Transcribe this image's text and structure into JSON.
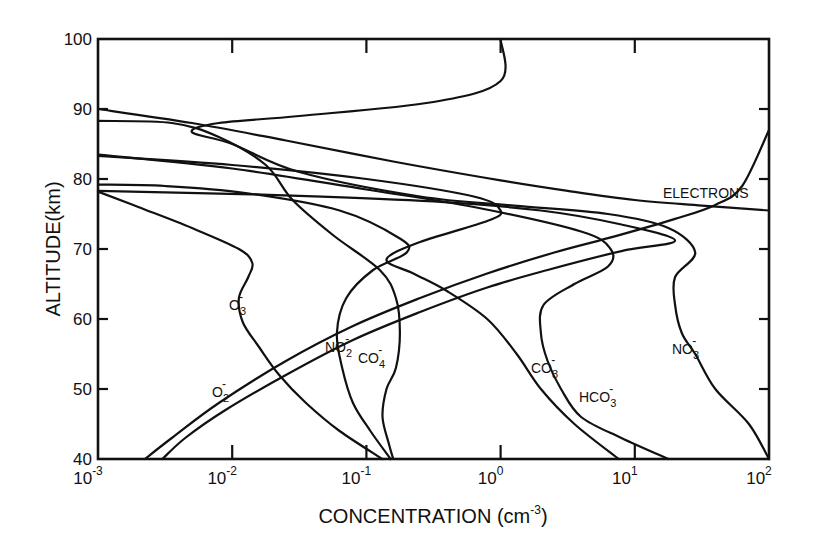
{
  "chart_data": {
    "type": "line",
    "title": "",
    "xlabel": "CONCENTRATION (cm^-3)",
    "ylabel": "ALTITUDE (km)",
    "xscale": "log",
    "xlim": [
      0.001,
      100
    ],
    "ylim": [
      40,
      100
    ],
    "grid": false,
    "legend": "inline labels",
    "x_ticks": [
      {
        "base": "10",
        "exp": "-3",
        "value": 0.001
      },
      {
        "base": "10",
        "exp": "-2",
        "value": 0.01
      },
      {
        "base": "10",
        "exp": "-1",
        "value": 0.1
      },
      {
        "base": "10",
        "exp": "0",
        "value": 1
      },
      {
        "base": "10",
        "exp": "1",
        "value": 10
      },
      {
        "base": "10",
        "exp": "2",
        "value": 100
      }
    ],
    "y_ticks": [
      40,
      50,
      60,
      70,
      80,
      90,
      100
    ],
    "series_note": "points are [log10(concentration), altitude_km]",
    "series": [
      {
        "name": "ELECTRONS",
        "points": [
          [
            -2.65,
            40
          ],
          [
            -2.45,
            43
          ],
          [
            -2.1,
            48
          ],
          [
            -1.6,
            54
          ],
          [
            -1.1,
            59
          ],
          [
            -0.6,
            63
          ],
          [
            -0.1,
            66.5
          ],
          [
            0.4,
            69.5
          ],
          [
            0.85,
            71.8
          ],
          [
            1.3,
            74.3
          ],
          [
            1.6,
            76.3
          ],
          [
            1.8,
            79
          ],
          [
            2.0,
            87
          ]
        ]
      },
      {
        "name": "O2-",
        "points": [
          [
            -2.52,
            40
          ],
          [
            -2.35,
            43
          ],
          [
            -2.05,
            47
          ],
          [
            -1.6,
            52
          ],
          [
            -1.1,
            57
          ],
          [
            -0.6,
            61
          ],
          [
            -0.1,
            64.5
          ],
          [
            0.35,
            67
          ],
          [
            0.9,
            69.7
          ],
          [
            1.3,
            71.2
          ],
          [
            0.9,
            73.5
          ],
          [
            0.3,
            75.5
          ],
          [
            -0.5,
            76.8
          ],
          [
            -1.5,
            77.6
          ],
          [
            -2.5,
            78.1
          ],
          [
            -3,
            78.3
          ]
        ]
      },
      {
        "name": "O3-",
        "points": [
          [
            -0.88,
            40
          ],
          [
            -1.2,
            44
          ],
          [
            -1.45,
            48
          ],
          [
            -1.65,
            52
          ],
          [
            -1.8,
            56
          ],
          [
            -1.92,
            59.5
          ],
          [
            -1.95,
            63
          ],
          [
            -1.88,
            66
          ],
          [
            -1.85,
            68
          ],
          [
            -1.95,
            70
          ],
          [
            -2.3,
            73
          ],
          [
            -2.7,
            76
          ],
          [
            -3,
            78.2
          ]
        ]
      },
      {
        "name": "NO2-",
        "points": [
          [
            -0.82,
            40
          ],
          [
            -0.97,
            44
          ],
          [
            -1.1,
            48
          ],
          [
            -1.18,
            53
          ],
          [
            -1.22,
            58
          ],
          [
            -1.15,
            63
          ],
          [
            -0.95,
            67
          ],
          [
            -0.7,
            69.5
          ],
          [
            -0.75,
            71.5
          ],
          [
            -1.2,
            75.5
          ],
          [
            -1.9,
            78
          ],
          [
            -2.5,
            79
          ],
          [
            -3,
            79.2
          ]
        ]
      },
      {
        "name": "CO4-",
        "points": [
          [
            -0.8,
            40
          ],
          [
            -0.83,
            42
          ],
          [
            -0.88,
            46
          ],
          [
            -0.85,
            50
          ],
          [
            -0.78,
            53
          ],
          [
            -0.75,
            58
          ],
          [
            -0.78,
            63
          ],
          [
            -0.9,
            67
          ],
          [
            -1.25,
            72
          ],
          [
            -1.55,
            77
          ],
          [
            -1.75,
            82
          ],
          [
            -2.1,
            86
          ],
          [
            -2.45,
            88
          ],
          [
            -3,
            88.3
          ]
        ]
      },
      {
        "name": "CO3-",
        "points": [
          [
            0.88,
            40
          ],
          [
            0.55,
            45
          ],
          [
            0.3,
            50
          ],
          [
            0.12,
            55
          ],
          [
            -0.1,
            60
          ],
          [
            -0.4,
            64
          ],
          [
            -0.65,
            66.5
          ],
          [
            -0.85,
            68.5
          ],
          [
            -0.6,
            71
          ],
          [
            -0.1,
            74
          ],
          [
            0.0,
            75.5
          ],
          [
            -0.2,
            77.5
          ],
          [
            -1.0,
            80
          ],
          [
            -2.0,
            82
          ],
          [
            -3,
            83.3
          ]
        ]
      },
      {
        "name": "HCO3-",
        "points": [
          [
            1.25,
            40
          ],
          [
            0.9,
            43
          ],
          [
            0.6,
            46
          ],
          [
            0.45,
            50
          ],
          [
            0.35,
            54
          ],
          [
            0.3,
            58
          ],
          [
            0.32,
            62
          ],
          [
            0.55,
            65
          ],
          [
            0.8,
            67.5
          ],
          [
            0.82,
            70
          ],
          [
            0.6,
            72.5
          ],
          [
            -0.2,
            76
          ],
          [
            -1.0,
            78.5
          ],
          [
            -2.0,
            81.5
          ],
          [
            -3,
            83.5
          ]
        ]
      },
      {
        "name": "NO3-",
        "points": [
          [
            2.0,
            40
          ],
          [
            1.85,
            45
          ],
          [
            1.6,
            50
          ],
          [
            1.45,
            55
          ],
          [
            1.35,
            58
          ],
          [
            1.3,
            62
          ],
          [
            1.3,
            66
          ],
          [
            1.45,
            69.5
          ],
          [
            1.25,
            73
          ],
          [
            0.8,
            75
          ],
          [
            0.1,
            76.2
          ],
          [
            -0.6,
            77.5
          ],
          [
            -1.5,
            81
          ],
          [
            -2.0,
            85
          ],
          [
            -2.3,
            86.7
          ],
          [
            -2.1,
            88
          ],
          [
            -1.5,
            89
          ],
          [
            -0.5,
            91
          ],
          [
            0,
            94
          ],
          [
            0.0,
            100
          ]
        ]
      },
      {
        "name": "(unlabeled, from left edge at 90 km)",
        "points": [
          [
            -3,
            90
          ],
          [
            -2.3,
            88
          ],
          [
            -1.6,
            85.5
          ],
          [
            -0.8,
            82.5
          ],
          [
            0,
            79.8
          ],
          [
            0.5,
            78.3
          ],
          [
            1.0,
            77
          ],
          [
            1.5,
            76.2
          ],
          [
            2.0,
            75.5
          ]
        ]
      }
    ],
    "labels": [
      {
        "text": "ELECTRONS",
        "x_log": 1.75,
        "km": 77.6
      },
      {
        "text": "NO3-",
        "x_log": 1.5,
        "km": 58
      },
      {
        "text": "HCO3-",
        "x_log": 0.75,
        "km": 49
      },
      {
        "text": "CO3-",
        "x_log": 0.3,
        "km": 53
      },
      {
        "text": "CO4-",
        "x_log": -0.9,
        "km": 56
      },
      {
        "text": "NO2-",
        "x_log": -1.25,
        "km": 57
      },
      {
        "text": "O3-",
        "x_log": -1.95,
        "km": 62
      },
      {
        "text": "O2-",
        "x_log": -1.85,
        "km": 49
      }
    ]
  },
  "axes": {
    "y_label": "ALTITUDE(km)",
    "x_label_main": "CONCENTRATION (cm",
    "x_label_exp": "-3",
    "x_label_close": ")"
  },
  "curve_labels": {
    "electrons": "ELECTRONS",
    "no3": {
      "base": "NO",
      "sub": "3",
      "sup": "-"
    },
    "hco3": {
      "base": "HCO",
      "sub": "3",
      "sup": "-"
    },
    "co3": {
      "base": "CO",
      "sub": "3",
      "sup": "-"
    },
    "co4": {
      "base": "CO",
      "sub": "4",
      "sup": "-"
    },
    "no2": {
      "base": "NO",
      "sub": "2",
      "sup": "-"
    },
    "o3": {
      "base": "O",
      "sub": "3",
      "sup": "-"
    },
    "o2": {
      "base": "O",
      "sub": "2",
      "sup": "-"
    }
  }
}
